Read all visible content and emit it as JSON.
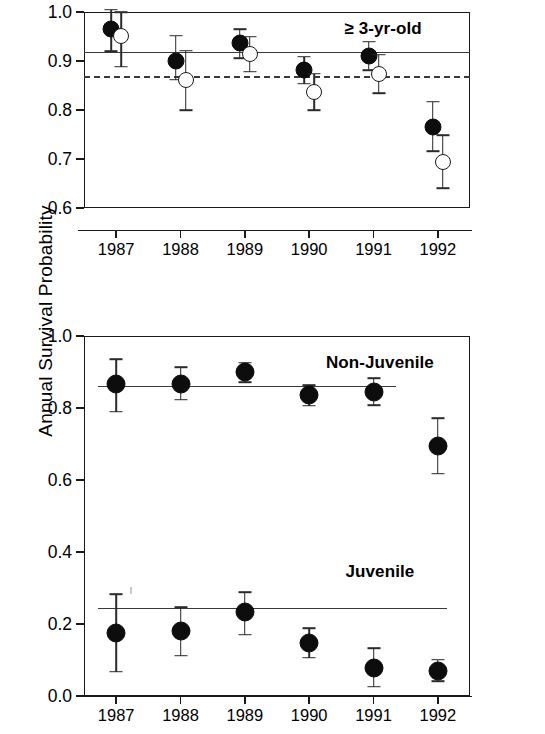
{
  "figure": {
    "axis_title_left": "Annual Survival Probability",
    "axis_title_right": "Annual Survival Probability",
    "marker_colors": {
      "filled": "#0d0d0d",
      "open": "#ffffff",
      "outline": "#1a1a1a",
      "refline": "#3a3a3a"
    }
  },
  "chart_data": [
    {
      "type": "scatter",
      "title": "",
      "annotation": "≥ 3-yr-old",
      "xlabel": "",
      "ylabel": "Annual Survival Probability",
      "x": [
        "1987",
        "1988",
        "1989",
        "1990",
        "1991",
        "1992"
      ],
      "xlim": [
        1986.5,
        1992.5
      ],
      "ylim": [
        0.6,
        1.0
      ],
      "yticks": [
        "0.6",
        "0.7",
        "0.8",
        "0.9",
        "1.0"
      ],
      "grid": false,
      "legend": "none",
      "series": [
        {
          "name": "filled-circle-series",
          "marker": "filled",
          "values": [
            0.965,
            0.9,
            0.937,
            0.881,
            0.91,
            0.765
          ],
          "err_low": [
            0.92,
            0.862,
            0.906,
            0.854,
            0.881,
            0.716
          ],
          "err_high": [
            1.005,
            0.952,
            0.965,
            0.909,
            0.939,
            0.817
          ]
        },
        {
          "name": "open-circle-series",
          "marker": "open",
          "values": [
            0.952,
            0.861,
            0.914,
            0.836,
            0.873,
            0.694
          ],
          "err_low": [
            0.888,
            0.8,
            0.878,
            0.799,
            0.834,
            0.64
          ],
          "err_high": [
            1.0,
            0.921,
            0.95,
            0.874,
            0.913,
            0.748
          ]
        }
      ],
      "reference_lines": [
        {
          "name": "solid-reference-line",
          "style": "solid",
          "value": 0.918
        },
        {
          "name": "dashed-reference-line",
          "style": "dashed",
          "value": 0.869
        }
      ]
    },
    {
      "type": "scatter",
      "title": "",
      "xlabel": "",
      "ylabel": "Annual Survival Probability",
      "x": [
        "1987",
        "1988",
        "1989",
        "1990",
        "1991",
        "1992"
      ],
      "xlim": [
        1986.5,
        1992.5
      ],
      "ylim": [
        0.0,
        1.0
      ],
      "yticks": [
        "0.0",
        "0.2",
        "0.4",
        "0.6",
        "0.8",
        "1.0"
      ],
      "grid": false,
      "legend": "none",
      "series": [
        {
          "name": "non-juvenile",
          "label": "Non-Juvenile",
          "marker": "filled",
          "values": [
            0.866,
            0.868,
            0.899,
            0.836,
            0.845,
            0.694
          ],
          "err_low": [
            0.79,
            0.823,
            0.872,
            0.806,
            0.808,
            0.618
          ],
          "err_high": [
            0.935,
            0.913,
            0.926,
            0.863,
            0.883,
            0.772
          ]
        },
        {
          "name": "juvenile",
          "label": "Juvenile",
          "marker": "filled",
          "values": [
            0.176,
            0.181,
            0.233,
            0.146,
            0.079,
            0.07
          ],
          "err_low": [
            0.068,
            0.112,
            0.17,
            0.106,
            0.026,
            0.041
          ],
          "err_high": [
            0.283,
            0.246,
            0.288,
            0.188,
            0.133,
            0.101
          ]
        }
      ],
      "reference_lines": [
        {
          "name": "non-juvenile-trend-line",
          "style": "solid",
          "value": 0.86
        },
        {
          "name": "juvenile-trend-line",
          "style": "solid",
          "value": 0.245
        }
      ],
      "group_labels": [
        {
          "name": "non-juvenile-label",
          "text": "Non-Juvenile",
          "y": 0.925
        },
        {
          "name": "juvenile-label",
          "text": "Juvenile",
          "y": 0.345
        }
      ]
    }
  ]
}
